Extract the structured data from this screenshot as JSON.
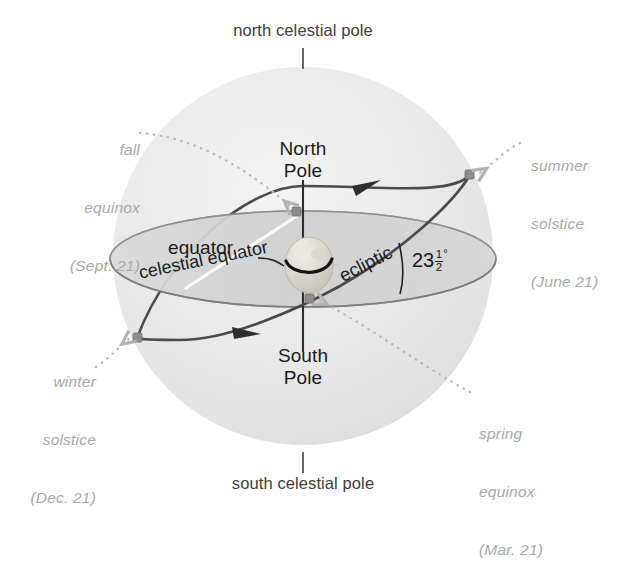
{
  "diagram": {
    "colors": {
      "sphere_fill": "#e9e9e9",
      "plane_fill": "#d2d2d2",
      "ecliptic_stroke": "#4a4a4a",
      "marker": "#8c8c8c",
      "label_black": "#1b1b1b",
      "label_gray": "#a8a8a8",
      "pole_label": "#3d3d3d",
      "background": "#ffffff"
    }
  },
  "labels": {
    "north_celestial_pole": "north celestial pole",
    "south_celestial_pole": "south celestial pole",
    "north_pole_line1": "North",
    "north_pole_line2": "Pole",
    "south_pole_line1": "South",
    "south_pole_line2": "Pole",
    "equator": "equator",
    "celestial_equator": "celestial equator",
    "ecliptic": "ecliptic"
  },
  "tilt_angle": {
    "whole": "23",
    "numerator": "1",
    "denominator": "2",
    "degree_symbol": "°",
    "value_text": "23 1/2 degrees"
  },
  "season_points": [
    {
      "id": "fall-equinox",
      "line1": "fall",
      "line2": "equinox",
      "line3": "(Sept. 21)",
      "align": "right"
    },
    {
      "id": "summer-solstice",
      "line1": "summer",
      "line2": "solstice",
      "line3": "(June 21)",
      "align": "left"
    },
    {
      "id": "winter-solstice",
      "line1": "winter",
      "line2": "solstice",
      "line3": "(Dec. 21)",
      "align": "right"
    },
    {
      "id": "spring-equinox",
      "line1": "spring",
      "line2": "equinox",
      "line3": "(Mar. 21)",
      "align": "left"
    }
  ]
}
